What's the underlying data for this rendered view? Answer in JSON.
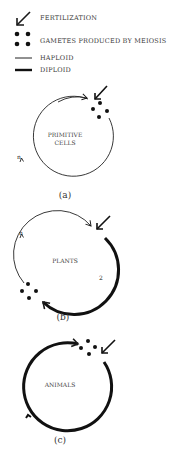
{
  "legend": {
    "items": [
      {
        "icon": "fertilization-arrow-icon",
        "label": "FERTILIZATION"
      },
      {
        "icon": "gametes-dots-icon",
        "label": "GAMETES PRODUCED BY MEIOSIS"
      },
      {
        "icon": "thin-line-icon",
        "label": "HAPLOID"
      },
      {
        "icon": "thick-line-icon",
        "label": "DIPLOID"
      }
    ]
  },
  "panels": [
    {
      "id": "a",
      "center_label_1": "PRIMITIVE",
      "center_label_2": "CELLS",
      "caption": "(a)",
      "ploidy_labels": [
        "n"
      ]
    },
    {
      "id": "b",
      "center_label_1": "PLANTS",
      "caption": "(b)",
      "ploidy_labels": [
        "n",
        "2"
      ]
    },
    {
      "id": "c",
      "center_label_1": "ANIMALS",
      "caption": "(c)",
      "ploidy_labels": []
    }
  ],
  "colors": {
    "line": "#1a1a1a",
    "text": "#3a3a3a",
    "background": "#ffffff"
  }
}
